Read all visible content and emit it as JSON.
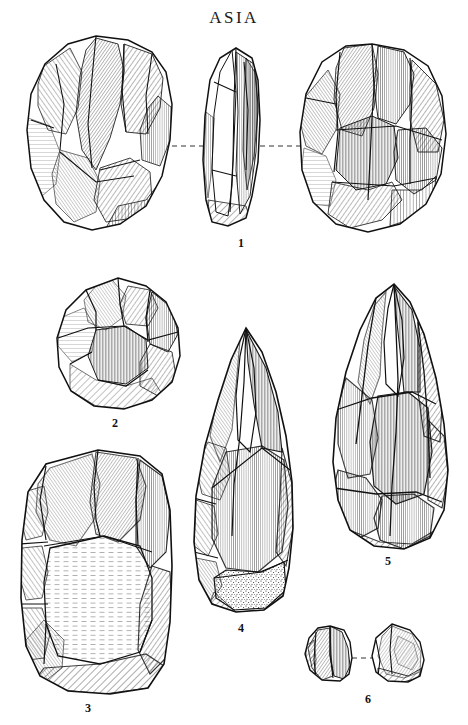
{
  "plate": {
    "title": "ASIA",
    "background_color": "#ffffff",
    "ink_color": "#111111",
    "width": 468,
    "height": 725,
    "medium": "pen-and-ink line drawing, hatched and stippled",
    "subject": "Palaeolithic chipped stone tools"
  },
  "figures": [
    {
      "number": "1",
      "label": "1",
      "name": "biface-handaxe-three-views",
      "views": [
        "ventral face (left)",
        "profile / edge (centre)",
        "dorsal face (right)"
      ],
      "connector": "dashed tie-lines joining the three views",
      "bbox": [
        18,
        32,
        450,
        232
      ]
    },
    {
      "number": "2",
      "label": "2",
      "name": "discoidal-core-chopper",
      "views": [
        "single face"
      ],
      "connector": "none",
      "bbox": [
        55,
        276,
        182,
        412
      ]
    },
    {
      "number": "3",
      "label": "3",
      "name": "large-rectangular-core-flake",
      "views": [
        "single face"
      ],
      "connector": "none",
      "bbox": [
        14,
        446,
        178,
        698
      ]
    },
    {
      "number": "4",
      "label": "4",
      "name": "pointed-handaxe-with-cortex-butt",
      "views": [
        "single face"
      ],
      "connector": "none",
      "bbox": [
        190,
        324,
        300,
        618
      ]
    },
    {
      "number": "5",
      "label": "5",
      "name": "elongated-pick-handaxe",
      "views": [
        "single face"
      ],
      "connector": "none",
      "bbox": [
        325,
        280,
        452,
        552
      ]
    },
    {
      "number": "6",
      "label": "6",
      "name": "paired-flake-fragments",
      "views": [
        "left fragment",
        "right fragment"
      ],
      "connector": "dashed tie-line joining the two fragments",
      "bbox": [
        300,
        618,
        430,
        688
      ]
    }
  ]
}
